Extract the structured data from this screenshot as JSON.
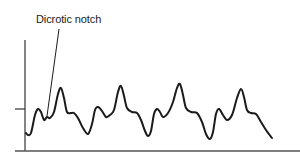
{
  "figure": {
    "annotation": "Dicrotic notch",
    "colors": {
      "line": "#1a1a1a",
      "axis": "#333333",
      "background": "#ffffff"
    }
  },
  "chart_data": {
    "type": "line",
    "title": "",
    "xlabel": "",
    "ylabel": "",
    "annotations": [
      "Dicrotic notch"
    ],
    "grid": false,
    "points": [
      [
        26,
        133
      ],
      [
        28,
        135
      ],
      [
        31,
        133
      ],
      [
        35,
        115
      ],
      [
        38,
        109
      ],
      [
        41,
        112
      ],
      [
        44,
        120
      ],
      [
        47,
        117
      ],
      [
        50,
        118
      ],
      [
        54,
        112
      ],
      [
        58,
        94
      ],
      [
        61,
        88
      ],
      [
        64,
        98
      ],
      [
        67,
        112
      ],
      [
        71,
        113
      ],
      [
        74,
        113
      ],
      [
        78,
        118
      ],
      [
        83,
        128
      ],
      [
        88,
        134
      ],
      [
        92,
        124
      ],
      [
        95,
        110
      ],
      [
        98,
        107
      ],
      [
        102,
        111
      ],
      [
        106,
        117
      ],
      [
        110,
        115
      ],
      [
        114,
        110
      ],
      [
        118,
        92
      ],
      [
        121,
        86
      ],
      [
        124,
        96
      ],
      [
        127,
        108
      ],
      [
        132,
        112
      ],
      [
        137,
        113
      ],
      [
        141,
        120
      ],
      [
        145,
        131
      ],
      [
        148,
        136
      ],
      [
        151,
        131
      ],
      [
        154,
        114
      ],
      [
        157,
        109
      ],
      [
        160,
        112
      ],
      [
        163,
        117
      ],
      [
        168,
        113
      ],
      [
        173,
        102
      ],
      [
        177,
        88
      ],
      [
        180,
        84
      ],
      [
        183,
        95
      ],
      [
        186,
        108
      ],
      [
        191,
        112
      ],
      [
        197,
        113
      ],
      [
        202,
        122
      ],
      [
        206,
        134
      ],
      [
        210,
        139
      ],
      [
        213,
        132
      ],
      [
        216,
        114
      ],
      [
        219,
        109
      ],
      [
        223,
        115
      ],
      [
        227,
        120
      ],
      [
        232,
        115
      ],
      [
        237,
        98
      ],
      [
        241,
        89
      ],
      [
        244,
        97
      ],
      [
        247,
        110
      ],
      [
        251,
        113
      ],
      [
        256,
        114
      ],
      [
        261,
        122
      ],
      [
        266,
        130
      ],
      [
        272,
        138
      ]
    ],
    "axes": {
      "y_axis_x": 25,
      "y_top": 40,
      "baseline_y": 151,
      "tick_y": 109
    }
  }
}
